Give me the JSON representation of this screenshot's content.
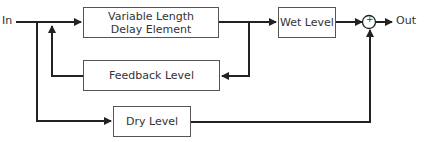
{
  "diagram": {
    "title": "",
    "input_label": "In",
    "output_label": "Out",
    "blocks": [
      {
        "id": "delay",
        "label": "Variable Length Delay Element"
      },
      {
        "id": "feedback",
        "label": "Feedback Level"
      },
      {
        "id": "dry",
        "label": "Dry Level"
      },
      {
        "id": "wet",
        "label": "Wet Level"
      }
    ],
    "summer_symbol": "+",
    "connections": [
      {
        "from": "In",
        "to": "delay"
      },
      {
        "from": "In",
        "to": "dry"
      },
      {
        "from": "delay",
        "to": "wet"
      },
      {
        "from": "delay",
        "to": "feedback"
      },
      {
        "from": "feedback",
        "to": "delay-input"
      },
      {
        "from": "wet",
        "to": "summer"
      },
      {
        "from": "dry",
        "to": "summer"
      },
      {
        "from": "summer",
        "to": "Out"
      }
    ],
    "line_color": "#222222"
  }
}
